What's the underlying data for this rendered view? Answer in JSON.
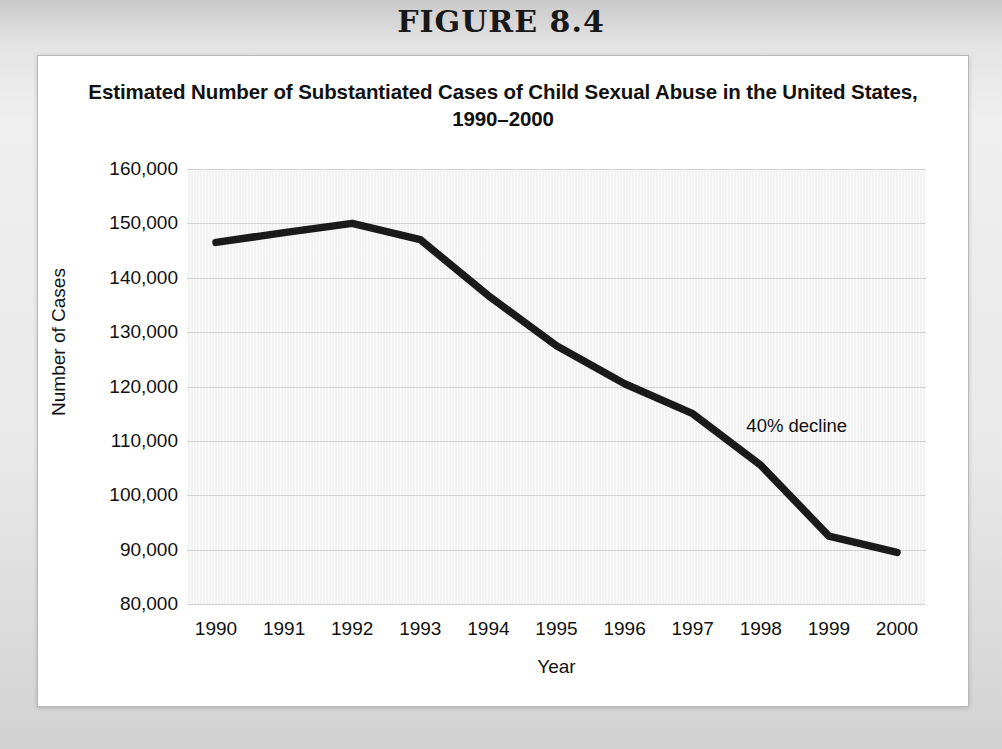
{
  "figure": {
    "heading": "FIGURE 8.4",
    "title": "Estimated Number of Substantiated Cases of Child Sexual Abuse in the United States, 1990–2000"
  },
  "annotation": {
    "text": "40% decline"
  },
  "axes": {
    "y_labels": [
      "160,000",
      "150,000",
      "140,000",
      "130,000",
      "120,000",
      "110,000",
      "100,000",
      "90,000",
      "80,000"
    ],
    "x_labels": [
      "1990",
      "1991",
      "1992",
      "1993",
      "1994",
      "1995",
      "1996",
      "1997",
      "1998",
      "1999",
      "2000"
    ],
    "y_title": "Number of Cases",
    "x_title": "Year"
  },
  "colors": {
    "line": "#1a1a1a",
    "plot_background": "#f2f2f2",
    "gridline": "#d3d3d3",
    "card": "#ffffff",
    "page": "#e4e4e4",
    "text": "#111111"
  },
  "chart_data": {
    "type": "line",
    "title": "Estimated Number of Substantiated Cases of Child Sexual Abuse in the United States, 1990–2000",
    "xlabel": "Year",
    "ylabel": "Number of Cases",
    "categories": [
      "1990",
      "1991",
      "1992",
      "1993",
      "1994",
      "1995",
      "1996",
      "1997",
      "1998",
      "1999",
      "2000"
    ],
    "x": [
      1990,
      1991,
      1992,
      1993,
      1994,
      1995,
      1996,
      1997,
      1998,
      1999,
      2000
    ],
    "values": [
      146500,
      148300,
      150000,
      147000,
      136700,
      127500,
      120500,
      115000,
      105500,
      92500,
      89500
    ],
    "series": [
      {
        "name": "Substantiated cases of child sexual abuse",
        "values": [
          146500,
          148300,
          150000,
          147000,
          136700,
          127500,
          120500,
          115000,
          105500,
          92500,
          89500
        ]
      }
    ],
    "ylim": [
      80000,
      160000
    ],
    "yticks": [
      80000,
      90000,
      100000,
      110000,
      120000,
      130000,
      140000,
      150000,
      160000
    ],
    "xlim": [
      1990,
      2000
    ],
    "grid": "horizontal",
    "legend": "none",
    "annotations": [
      {
        "text": "40% decline",
        "x": 1995.6,
        "y": 133500
      }
    ]
  }
}
